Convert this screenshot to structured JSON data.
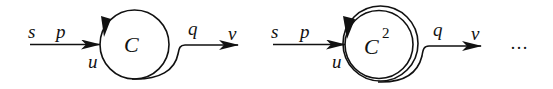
{
  "diagrams": [
    {
      "id": "cycle-once",
      "labels": {
        "s": "s",
        "p": "p",
        "u": "u",
        "cycle": "C",
        "cycle_sup": "",
        "q": "q",
        "v": "v"
      },
      "loops": 1
    },
    {
      "id": "cycle-twice",
      "labels": {
        "s": "s",
        "p": "p",
        "u": "u",
        "cycle": "C",
        "cycle_sup": "2",
        "q": "q",
        "v": "v"
      },
      "loops": 2
    }
  ],
  "continuation": "…",
  "colors": {
    "stroke": "#111111",
    "background": "#ffffff"
  }
}
